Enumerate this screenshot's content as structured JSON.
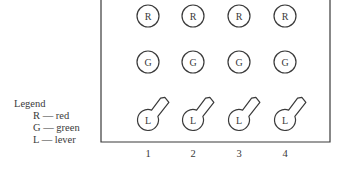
{
  "legend": {
    "title": "Legend",
    "items": [
      {
        "symbol": "R",
        "meaning": "red",
        "text": "R — red"
      },
      {
        "symbol": "G",
        "meaning": "green",
        "text": "G — green"
      },
      {
        "symbol": "L",
        "meaning": "lever",
        "text": "L — lever"
      }
    ]
  },
  "panel": {
    "rows": [
      {
        "type": "light",
        "label": "R"
      },
      {
        "type": "light",
        "label": "G"
      },
      {
        "type": "lever",
        "label": "L"
      }
    ],
    "columns": [
      "1",
      "2",
      "3",
      "4"
    ]
  },
  "colors": {
    "stroke": "#3a3a3a",
    "background": "#ffffff"
  }
}
